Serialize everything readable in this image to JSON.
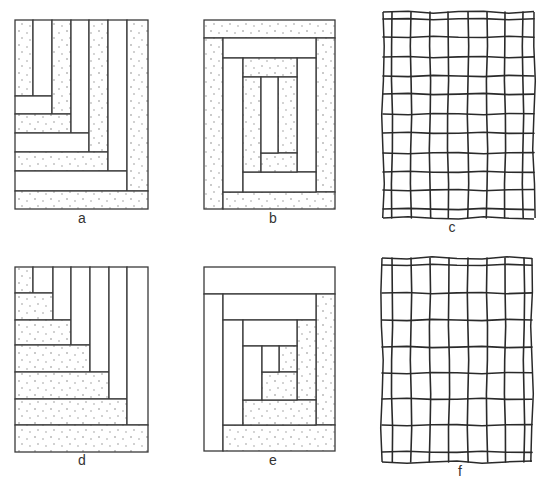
{
  "figure": {
    "colors": {
      "line": "#3a3a3a",
      "stipple_dot": "#7a7a7a",
      "background": "#ffffff"
    },
    "panels": [
      {
        "id": "a",
        "label": "a",
        "kind": "log-cabin-corner",
        "label_pos": [
          82,
          223
        ],
        "blocks": [
          {
            "x": 15,
            "y": 20,
            "w": 18,
            "h": 76,
            "shaded": true
          },
          {
            "x": 33,
            "y": 20,
            "w": 19,
            "h": 76,
            "shaded": false
          },
          {
            "x": 15,
            "y": 96,
            "w": 37,
            "h": 18,
            "shaded": false
          },
          {
            "x": 52,
            "y": 20,
            "w": 19,
            "h": 94,
            "shaded": true
          },
          {
            "x": 15,
            "y": 114,
            "w": 56,
            "h": 19,
            "shaded": true
          },
          {
            "x": 71,
            "y": 20,
            "w": 18,
            "h": 113,
            "shaded": false
          },
          {
            "x": 15,
            "y": 133,
            "w": 74,
            "h": 19,
            "shaded": false
          },
          {
            "x": 89,
            "y": 20,
            "w": 19,
            "h": 132,
            "shaded": true
          },
          {
            "x": 15,
            "y": 152,
            "w": 93,
            "h": 19,
            "shaded": true
          },
          {
            "x": 108,
            "y": 20,
            "w": 19,
            "h": 151,
            "shaded": false
          },
          {
            "x": 15,
            "y": 171,
            "w": 112,
            "h": 20,
            "shaded": false
          },
          {
            "x": 127,
            "y": 20,
            "w": 21,
            "h": 171,
            "shaded": true
          },
          {
            "x": 15,
            "y": 191,
            "w": 133,
            "h": 18,
            "shaded": true
          }
        ]
      },
      {
        "id": "b",
        "label": "b",
        "kind": "log-cabin-concentric",
        "label_pos": [
          273,
          223
        ],
        "blocks": [
          {
            "x": 204,
            "y": 20,
            "w": 131,
            "h": 18,
            "shaded": true
          },
          {
            "x": 204,
            "y": 38,
            "w": 19,
            "h": 171,
            "shaded": true
          },
          {
            "x": 316,
            "y": 38,
            "w": 19,
            "h": 154,
            "shaded": true
          },
          {
            "x": 223,
            "y": 192,
            "w": 112,
            "h": 17,
            "shaded": true
          },
          {
            "x": 223,
            "y": 38,
            "w": 93,
            "h": 20,
            "shaded": false
          },
          {
            "x": 223,
            "y": 58,
            "w": 20,
            "h": 134,
            "shaded": false
          },
          {
            "x": 297,
            "y": 58,
            "w": 19,
            "h": 114,
            "shaded": false
          },
          {
            "x": 243,
            "y": 172,
            "w": 73,
            "h": 20,
            "shaded": false
          },
          {
            "x": 243,
            "y": 58,
            "w": 54,
            "h": 19,
            "shaded": true
          },
          {
            "x": 243,
            "y": 77,
            "w": 18,
            "h": 95,
            "shaded": true
          },
          {
            "x": 278,
            "y": 77,
            "w": 19,
            "h": 76,
            "shaded": true
          },
          {
            "x": 261,
            "y": 153,
            "w": 36,
            "h": 19,
            "shaded": true
          },
          {
            "x": 261,
            "y": 77,
            "w": 17,
            "h": 76,
            "shaded": false
          }
        ]
      },
      {
        "id": "c",
        "label": "c",
        "kind": "hand-drawn-grid",
        "label_pos": [
          452,
          232
        ],
        "outline": {
          "x1": 383,
          "y1": 12,
          "x2": 534,
          "y2": 218
        },
        "verticals": [
          392,
          411,
          430,
          448,
          468,
          487,
          505,
          523
        ],
        "horizontals": [
          19,
          37,
          57,
          76,
          94,
          114,
          133,
          153,
          172,
          190,
          209
        ]
      },
      {
        "id": "d",
        "label": "d",
        "kind": "log-cabin-staircase",
        "label_pos": [
          82,
          465
        ],
        "blocks": [
          {
            "x": 15,
            "y": 267,
            "w": 18,
            "h": 26,
            "shaded": true
          },
          {
            "x": 33,
            "y": 267,
            "w": 20,
            "h": 26,
            "shaded": false
          },
          {
            "x": 15,
            "y": 293,
            "w": 38,
            "h": 27,
            "shaded": true
          },
          {
            "x": 53,
            "y": 267,
            "w": 18,
            "h": 53,
            "shaded": false
          },
          {
            "x": 15,
            "y": 320,
            "w": 56,
            "h": 25,
            "shaded": true
          },
          {
            "x": 71,
            "y": 267,
            "w": 19,
            "h": 78,
            "shaded": false
          },
          {
            "x": 15,
            "y": 345,
            "w": 75,
            "h": 27,
            "shaded": true
          },
          {
            "x": 90,
            "y": 267,
            "w": 19,
            "h": 105,
            "shaded": false
          },
          {
            "x": 15,
            "y": 372,
            "w": 94,
            "h": 27,
            "shaded": true
          },
          {
            "x": 109,
            "y": 267,
            "w": 18,
            "h": 132,
            "shaded": false
          },
          {
            "x": 15,
            "y": 399,
            "w": 112,
            "h": 26,
            "shaded": true
          },
          {
            "x": 127,
            "y": 267,
            "w": 21,
            "h": 158,
            "shaded": false
          },
          {
            "x": 15,
            "y": 425,
            "w": 133,
            "h": 27,
            "shaded": true
          }
        ]
      },
      {
        "id": "e",
        "label": "e",
        "kind": "log-cabin-concentric-split",
        "label_pos": [
          273,
          465
        ],
        "blocks": [
          {
            "x": 204,
            "y": 267,
            "w": 131,
            "h": 27,
            "shaded": false
          },
          {
            "x": 204,
            "y": 294,
            "w": 19,
            "h": 157,
            "shaded": false
          },
          {
            "x": 316,
            "y": 294,
            "w": 19,
            "h": 131,
            "shaded": true
          },
          {
            "x": 223,
            "y": 425,
            "w": 112,
            "h": 26,
            "shaded": true
          },
          {
            "x": 223,
            "y": 294,
            "w": 93,
            "h": 26,
            "shaded": false
          },
          {
            "x": 223,
            "y": 320,
            "w": 20,
            "h": 105,
            "shaded": false
          },
          {
            "x": 297,
            "y": 320,
            "w": 19,
            "h": 80,
            "shaded": true
          },
          {
            "x": 243,
            "y": 400,
            "w": 73,
            "h": 25,
            "shaded": true
          },
          {
            "x": 243,
            "y": 320,
            "w": 54,
            "h": 26,
            "shaded": false
          },
          {
            "x": 243,
            "y": 346,
            "w": 19,
            "h": 54,
            "shaded": false
          },
          {
            "x": 279,
            "y": 346,
            "w": 18,
            "h": 26,
            "shaded": true
          },
          {
            "x": 262,
            "y": 372,
            "w": 35,
            "h": 28,
            "shaded": true
          },
          {
            "x": 262,
            "y": 346,
            "w": 17,
            "h": 26,
            "shaded": false
          }
        ]
      },
      {
        "id": "f",
        "label": "f",
        "kind": "hand-drawn-grid",
        "label_pos": [
          460,
          476
        ],
        "outline": {
          "x1": 382,
          "y1": 258,
          "x2": 532,
          "y2": 462
        },
        "verticals": [
          392,
          411,
          430,
          449,
          468,
          487,
          505,
          524
        ],
        "horizontals": [
          265,
          293,
          320,
          347,
          373,
          399,
          425,
          452
        ]
      }
    ]
  }
}
